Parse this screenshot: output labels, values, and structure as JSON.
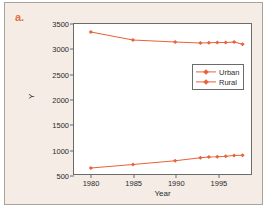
{
  "panel": {
    "label": "a.",
    "label_color": "#e0714a"
  },
  "chart_data": {
    "type": "line",
    "title": "",
    "subtitle": "",
    "xlabel": "Year",
    "ylabel": "Y",
    "xlim": [
      1978,
      1999
    ],
    "ylim": [
      500,
      3500
    ],
    "xticks": [
      1980,
      1985,
      1990,
      1995
    ],
    "yticks": [
      500,
      1000,
      1500,
      2000,
      2500,
      3000,
      3500
    ],
    "grid": false,
    "legend_position": "upper-right-inside",
    "line_color": "#e8633a",
    "marker": "diamond",
    "x": [
      1980,
      1985,
      1990,
      1993,
      1994,
      1995,
      1996,
      1997,
      1998
    ],
    "series": [
      {
        "name": "Urban",
        "values": [
          3340,
          3180,
          3140,
          3120,
          3125,
          3130,
          3130,
          3140,
          3095
        ]
      },
      {
        "name": "Rural",
        "values": [
          620,
          690,
          765,
          825,
          840,
          845,
          855,
          870,
          875
        ]
      }
    ],
    "legend": [
      "Urban",
      "Rural"
    ]
  },
  "axis": {
    "ytick_labels": [
      "500",
      "1000",
      "1500",
      "2000",
      "2500",
      "3000",
      "3500"
    ],
    "xtick_labels": [
      "1980",
      "1985",
      "1990",
      "1995"
    ],
    "x_axis_title": "Year",
    "y_axis_title": "Y"
  },
  "legend": {
    "items": [
      {
        "label": "Urban"
      },
      {
        "label": "Rural"
      }
    ]
  }
}
